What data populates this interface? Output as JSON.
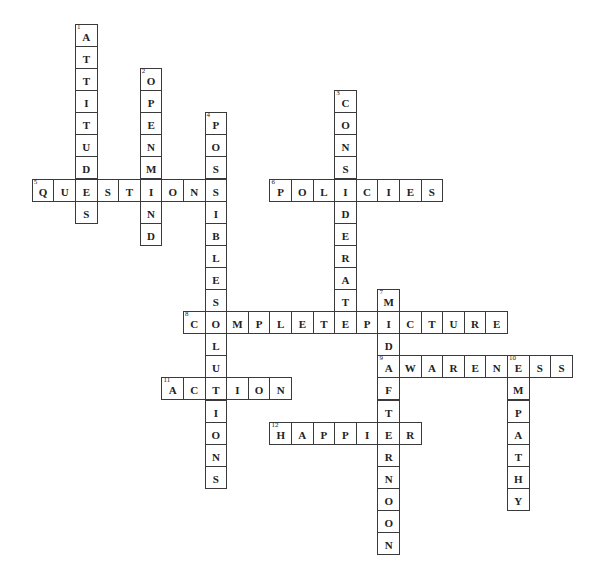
{
  "puzzle": {
    "grid": {
      "origin_x": 32.3,
      "origin_y": 24.3,
      "cell_w": 21.6,
      "cell_h": 22.1
    },
    "words": [
      {
        "number": 1,
        "answer": "ATTITUDES",
        "direction": "down",
        "row": 0,
        "col": 2
      },
      {
        "number": 2,
        "answer": "OPENMIND",
        "direction": "down",
        "row": 2,
        "col": 5
      },
      {
        "number": 3,
        "answer": "CONSIDERATE",
        "direction": "down",
        "row": 3,
        "col": 14
      },
      {
        "number": 4,
        "answer": "POSSIBLESOLUTIONS",
        "direction": "down",
        "row": 4,
        "col": 8
      },
      {
        "number": 5,
        "answer": "QUESTIONS",
        "direction": "across",
        "row": 7,
        "col": 0
      },
      {
        "number": 6,
        "answer": "POLICIES",
        "direction": "across",
        "row": 7,
        "col": 11
      },
      {
        "number": 7,
        "answer": "MIDAFTERNOON",
        "direction": "down",
        "row": 12,
        "col": 16
      },
      {
        "number": 8,
        "answer": "COMPLETEPICTURE",
        "direction": "across",
        "row": 13,
        "col": 7
      },
      {
        "number": 9,
        "answer": "AWARENESS",
        "direction": "across",
        "row": 15,
        "col": 16
      },
      {
        "number": 10,
        "answer": "EMPATHY",
        "direction": "down",
        "row": 15,
        "col": 22
      },
      {
        "number": 11,
        "answer": "ACTION",
        "direction": "across",
        "row": 16,
        "col": 6
      },
      {
        "number": 12,
        "answer": "HAPPIER",
        "direction": "across",
        "row": 18,
        "col": 11
      }
    ]
  }
}
